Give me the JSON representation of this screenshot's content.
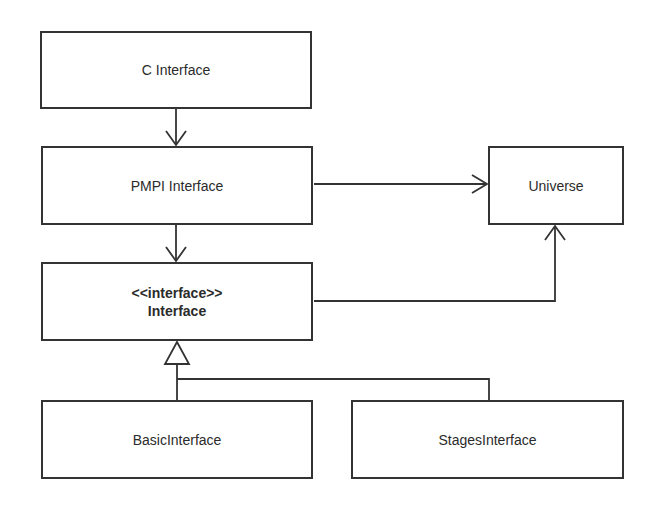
{
  "diagram": {
    "type": "uml-class-diagram",
    "colors": {
      "stroke": "#333333",
      "fill": "#ffffff",
      "text": "#2b2b2b"
    },
    "nodes": [
      {
        "id": "c_interface",
        "label": "C Interface",
        "stereotype": null,
        "bold": false
      },
      {
        "id": "pmpi_interface",
        "label": "PMPI Interface",
        "stereotype": null,
        "bold": false
      },
      {
        "id": "universe",
        "label": "Universe",
        "stereotype": null,
        "bold": false
      },
      {
        "id": "interface",
        "label": "Interface",
        "stereotype": "<<interface>>",
        "bold": true
      },
      {
        "id": "basic_interface",
        "label": "BasicInterface",
        "stereotype": null,
        "bold": false
      },
      {
        "id": "stages_interface",
        "label": "StagesInterface",
        "stereotype": null,
        "bold": false
      }
    ],
    "edges": [
      {
        "from": "c_interface",
        "to": "pmpi_interface",
        "kind": "association",
        "head": "open-arrow"
      },
      {
        "from": "pmpi_interface",
        "to": "interface",
        "kind": "association",
        "head": "open-arrow"
      },
      {
        "from": "pmpi_interface",
        "to": "universe",
        "kind": "association",
        "head": "open-arrow"
      },
      {
        "from": "interface",
        "to": "universe",
        "kind": "association",
        "head": "open-arrow"
      },
      {
        "from": "basic_interface",
        "to": "interface",
        "kind": "realization",
        "head": "hollow-triangle"
      },
      {
        "from": "stages_interface",
        "to": "interface",
        "kind": "realization",
        "head": "hollow-triangle"
      }
    ]
  }
}
